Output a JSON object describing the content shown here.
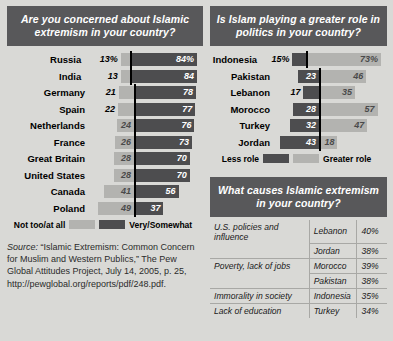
{
  "colors": {
    "page_bg": "#d9d9d6",
    "header_bg": "#58585a",
    "header_text": "#ffffff",
    "bar_light": "#b3b3b0",
    "bar_dark": "#4d4d4f",
    "axis": "#000000"
  },
  "panel_concern": {
    "title": "Are you concerned about Islamic extremism in your country?",
    "legend_left": "Not too/at all",
    "legend_right": "Very/Somewhat"
  },
  "panel_role": {
    "title": "Is Islam playing a greater role in politics in your country?",
    "legend_left": "Less role",
    "legend_right": "Greater role"
  },
  "panel_causes": {
    "title": "What causes Islamic extremism in your country?",
    "rows": [
      {
        "cause": "U.S. policies and influence",
        "country": "Lebanon",
        "pct": "40%"
      },
      {
        "cause": "",
        "country": "Jordan",
        "pct": "38%"
      },
      {
        "cause": "Poverty, lack of jobs",
        "country": "Morocco",
        "pct": "39%"
      },
      {
        "cause": "",
        "country": "Pakistan",
        "pct": "38%"
      },
      {
        "cause": "Immorality in society",
        "country": "Indonesia",
        "pct": "35%"
      },
      {
        "cause": "Lack of education",
        "country": "Turkey",
        "pct": "34%"
      }
    ]
  },
  "source": {
    "label": "Source:",
    "text": " “Islamic Extremism: Common Concern for Muslim and Western Publics,” The Pew Global Attitudes Project, July 14, 2005, p. 25, http://pewglobal.org/reports/pdf/248.pdf."
  },
  "chart_data": [
    {
      "type": "bar",
      "title": "Are you concerned about Islamic extremism in your country?",
      "orientation": "horizontal",
      "layout": "diverging",
      "xlabel": "",
      "ylabel": "",
      "grid": false,
      "legend_position": "bottom",
      "series": [
        {
          "name": "Not too/at all",
          "color": "#b3b3b0",
          "side": "left",
          "values": [
            13,
            13,
            21,
            22,
            24,
            26,
            28,
            28,
            41,
            49
          ]
        },
        {
          "name": "Very/Somewhat",
          "color": "#4d4d4f",
          "side": "right",
          "values": [
            84,
            84,
            78,
            77,
            76,
            73,
            70,
            70,
            56,
            37
          ]
        }
      ],
      "categories": [
        "Russia",
        "India",
        "Germany",
        "Spain",
        "Netherlands",
        "France",
        "Great Britain",
        "United States",
        "Canada",
        "Poland"
      ],
      "labels_left": [
        "13%",
        "13",
        "21",
        "22",
        "24",
        "26",
        "28",
        "28",
        "41",
        "49"
      ],
      "labels_right": [
        "84%",
        "84",
        "78",
        "77",
        "76",
        "73",
        "70",
        "70",
        "56",
        "37"
      ],
      "units": "percent"
    },
    {
      "type": "bar",
      "title": "Is Islam playing a greater role in politics in your country?",
      "orientation": "horizontal",
      "layout": "diverging",
      "xlabel": "",
      "ylabel": "",
      "grid": false,
      "legend_position": "bottom",
      "series": [
        {
          "name": "Less role",
          "color": "#4d4d4f",
          "side": "left",
          "values": [
            15,
            23,
            17,
            28,
            32,
            43
          ]
        },
        {
          "name": "Greater role",
          "color": "#b3b3b0",
          "side": "right",
          "values": [
            73,
            46,
            35,
            57,
            47,
            18
          ]
        }
      ],
      "categories": [
        "Indonesia",
        "Pakistan",
        "Lebanon",
        "Morocco",
        "Turkey",
        "Jordan"
      ],
      "labels_left": [
        "15%",
        "23",
        "17",
        "28",
        "32",
        "43"
      ],
      "labels_right": [
        "73%",
        "46",
        "35",
        "57",
        "47",
        "18"
      ],
      "units": "percent"
    },
    {
      "type": "table",
      "title": "What causes Islamic extremism in your country?",
      "columns": [
        "Cause",
        "Country",
        "Percent"
      ],
      "rows": [
        [
          "U.S. policies and influence",
          "Lebanon",
          "40%"
        ],
        [
          "U.S. policies and influence",
          "Jordan",
          "38%"
        ],
        [
          "Poverty, lack of jobs",
          "Morocco",
          "39%"
        ],
        [
          "Poverty, lack of jobs",
          "Pakistan",
          "38%"
        ],
        [
          "Immorality in society",
          "Indonesia",
          "35%"
        ],
        [
          "Lack of education",
          "Turkey",
          "34%"
        ]
      ]
    }
  ]
}
